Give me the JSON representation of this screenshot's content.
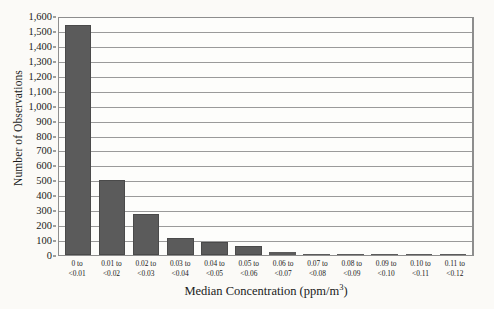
{
  "chart_data": {
    "type": "bar",
    "title": "",
    "subtitle": "",
    "xlabel_main": "Median Concentration (ppm/m",
    "xlabel_sup": "3",
    "xlabel_tail": ")",
    "xlabel_full": "Median Concentration (ppm/m3)",
    "ylabel": "Number of Observations",
    "ylim": [
      0,
      1600
    ],
    "ytick_step": 100,
    "grid": true,
    "legend": null,
    "bar_color": "#5b5b5b",
    "categories": [
      "0 to <0.01",
      "0.01 to <0.02",
      "0.02 to <0.03",
      "0.03 to <0.04",
      "0.04 to <0.05",
      "0.05 to <0.06",
      "0.06 to <0.07",
      "0.07 to <0.08",
      "0.08 to <0.09",
      "0.09 to <0.10",
      "0.10 to <0.11",
      "0.11 to <0.12"
    ],
    "category_lines": [
      [
        "0 to",
        "<0.01"
      ],
      [
        "0.01 to",
        "<0.02"
      ],
      [
        "0.02 to",
        "<0.03"
      ],
      [
        "0.03 to",
        "<0.04"
      ],
      [
        "0.04 to",
        "<0.05"
      ],
      [
        "0.05 to",
        "<0.06"
      ],
      [
        "0.06 to",
        "<0.07"
      ],
      [
        "0.07 to",
        "<0.08"
      ],
      [
        "0.08 to",
        "<0.09"
      ],
      [
        "0.09 to",
        "<0.10"
      ],
      [
        "0.10 to",
        "<0.11"
      ],
      [
        "0.11 to",
        "<0.12"
      ]
    ],
    "values": [
      1540,
      505,
      275,
      115,
      90,
      60,
      18,
      10,
      3,
      2,
      2,
      2
    ],
    "ytick_labels": [
      "1,600",
      "1,500",
      "1,400",
      "1,300",
      "1,200",
      "1,100",
      "1,000",
      "900",
      "800",
      "700",
      "600",
      "500",
      "400",
      "300",
      "200",
      "100",
      "0"
    ],
    "ytick_values": [
      1600,
      1500,
      1400,
      1300,
      1200,
      1100,
      1000,
      900,
      800,
      700,
      600,
      500,
      400,
      300,
      200,
      100,
      0
    ]
  }
}
